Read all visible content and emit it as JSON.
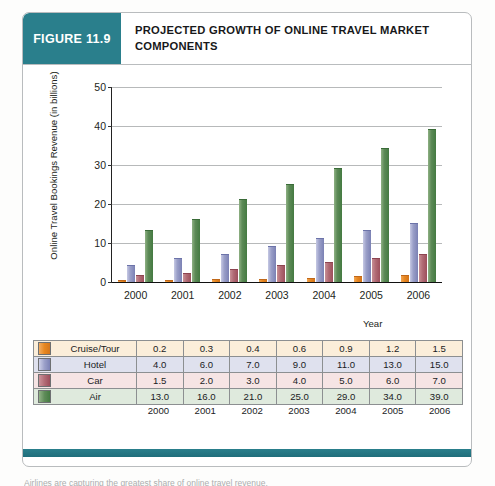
{
  "figure": {
    "tag_label": "FIGURE 11.9",
    "title": "PROJECTED GROWTH OF ONLINE TRAVEL MARKET COMPONENTS",
    "tag_color": "#2a7f8c",
    "rule_color": "#2a7f8c",
    "caption_cut": "Airlines are capturing the greatest share of online travel revenue."
  },
  "chart_data": {
    "type": "bar",
    "title": "PROJECTED GROWTH OF ONLINE TRAVEL MARKET COMPONENTS",
    "xlabel": "Year",
    "ylabel": "Online Travel Bookings Revenue (in billions)",
    "categories": [
      "2000",
      "2001",
      "2002",
      "2003",
      "2004",
      "2005",
      "2006"
    ],
    "ylim": [
      0,
      50
    ],
    "yticks": [
      0,
      10,
      20,
      30,
      40,
      50
    ],
    "grid": true,
    "legend": "table-below",
    "series": [
      {
        "name": "Cruise/Tour",
        "color": "#e8871f",
        "values": [
          0.2,
          0.3,
          0.4,
          0.6,
          0.9,
          1.2,
          1.5
        ]
      },
      {
        "name": "Hotel",
        "color": "#7c82b5",
        "values": [
          4.0,
          6.0,
          7.0,
          9.0,
          11.0,
          13.0,
          15.0
        ]
      },
      {
        "name": "Car",
        "color": "#9c4e5b",
        "values": [
          1.5,
          2.0,
          3.0,
          4.0,
          5.0,
          6.0,
          7.0
        ]
      },
      {
        "name": "Air",
        "color": "#457b42",
        "values": [
          13.0,
          16.0,
          21.0,
          25.0,
          29.0,
          34.0,
          39.0
        ]
      }
    ]
  },
  "table": {
    "row_labels": [
      "Cruise/Tour",
      "Hotel",
      "Car",
      "Air"
    ],
    "rows": [
      [
        "0.2",
        "0.3",
        "0.4",
        "0.6",
        "0.9",
        "1.2",
        "1.5"
      ],
      [
        "4.0",
        "6.0",
        "7.0",
        "9.0",
        "11.0",
        "13.0",
        "15.0"
      ],
      [
        "1.5",
        "2.0",
        "3.0",
        "4.0",
        "5.0",
        "6.0",
        "7.0"
      ],
      [
        "13.0",
        "16.0",
        "21.0",
        "25.0",
        "29.0",
        "34.0",
        "39.0"
      ]
    ],
    "year_footer": [
      "2000",
      "2001",
      "2002",
      "2003",
      "2004",
      "2005",
      "2006"
    ]
  }
}
